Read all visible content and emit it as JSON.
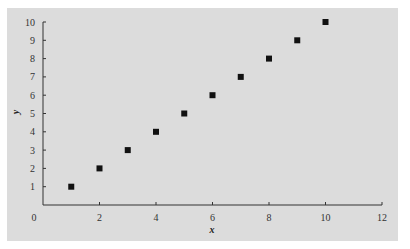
{
  "chart_data": {
    "type": "scatter",
    "title": "",
    "xlabel": "x",
    "ylabel": "y",
    "xlim": [
      0,
      12
    ],
    "ylim": [
      0,
      10
    ],
    "x_ticks": [
      0,
      2,
      4,
      6,
      8,
      10,
      12
    ],
    "y_ticks": [
      1,
      2,
      3,
      4,
      5,
      6,
      7,
      8,
      9,
      10
    ],
    "grid": false,
    "legend": null,
    "marker": "square",
    "series": [
      {
        "name": "data",
        "x": [
          1,
          2,
          3,
          4,
          5,
          6,
          7,
          8,
          9,
          10
        ],
        "y": [
          1,
          2,
          3,
          4,
          5,
          6,
          7,
          8,
          9,
          10
        ]
      }
    ],
    "colors": {
      "background": "#dcdcdc",
      "marker": "#111111",
      "axis": "#333333"
    }
  }
}
